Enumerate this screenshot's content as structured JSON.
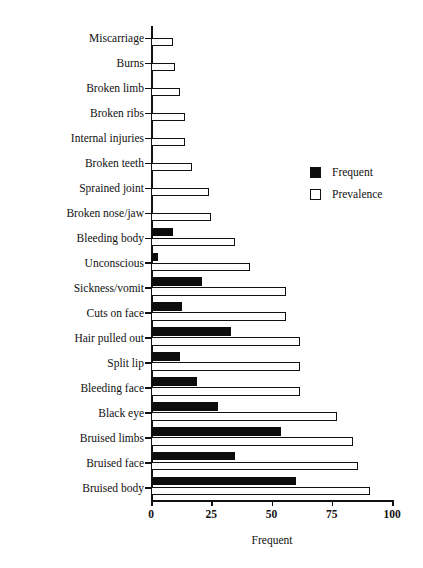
{
  "chart_data": {
    "type": "bar",
    "orientation": "horizontal",
    "title": "",
    "xlabel": "Frequent",
    "ylabel": "Nature of Injury",
    "xlim": [
      0,
      100
    ],
    "xticks": [
      0,
      25,
      50,
      75,
      100
    ],
    "xticklabels": [
      "0",
      "25",
      "50",
      "75",
      "100"
    ],
    "grid": false,
    "legend_position": "upper right",
    "categories": [
      "Miscarriage",
      "Burns",
      "Broken limb",
      "Broken ribs",
      "Internal injuries",
      "Broken teeth",
      "Sprained joint",
      "Broken nose/jaw",
      "Bleeding body",
      "Unconscious",
      "Sickness/vomit",
      "Cuts on face",
      "Hair pulled out",
      "Split lip",
      "Bleeding face",
      "Black eye",
      "Bruised limbs",
      "Bruised face",
      "Bruised body"
    ],
    "series": [
      {
        "name": "Frequent",
        "color": "#0d0d0d",
        "values": [
          0,
          0,
          0,
          0,
          0,
          0,
          0,
          0,
          9,
          3,
          21,
          13,
          33,
          12,
          19,
          28,
          54,
          35,
          60
        ]
      },
      {
        "name": "Prevalence",
        "color": "#ffffff",
        "values": [
          9,
          10,
          12,
          14,
          14,
          17,
          24,
          25,
          35,
          41,
          56,
          56,
          62,
          62,
          62,
          77,
          84,
          86,
          91
        ]
      }
    ]
  },
  "legend": {
    "items": [
      {
        "label": "Frequent",
        "swatch": "filled-square-icon"
      },
      {
        "label": "Prevalence",
        "swatch": "hollow-square-icon"
      }
    ]
  }
}
